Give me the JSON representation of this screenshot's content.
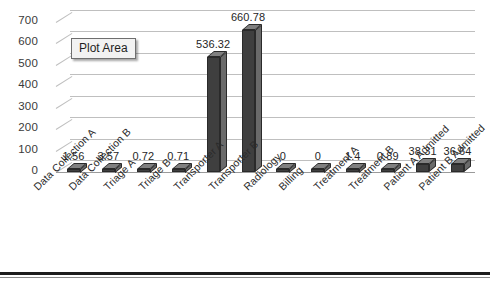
{
  "tooltip": {
    "label": "Plot Area"
  },
  "chart_data": {
    "type": "bar",
    "title": "",
    "xlabel": "",
    "ylabel": "",
    "ylim": [
      0,
      700
    ],
    "yticks": [
      700,
      600,
      500,
      400,
      300,
      200,
      100,
      0
    ],
    "grid": true,
    "legend": "none",
    "style": "3d-column",
    "series_color": "#3f3f3f",
    "gridline_color": "#bfbfbf",
    "categories": [
      "Data Collection A",
      "Data Collection B",
      "Triage A",
      "Triage B",
      "Transporter A",
      "Transporter B",
      "Radiology",
      "Billing",
      "Treatment A",
      "Treatment B",
      "Patient A Admitted",
      "Patient B Admitted"
    ],
    "values": [
      1.56,
      3.57,
      0.72,
      0.71,
      536.32,
      660.78,
      0,
      0,
      1.4,
      0.89,
      38.31,
      36.64
    ],
    "value_labels": [
      "1.56",
      "3.57",
      "0.72",
      "0.71",
      "536.32",
      "660.78",
      "0",
      "0",
      "1.4",
      "0.89",
      "38.31",
      "36.64"
    ]
  }
}
